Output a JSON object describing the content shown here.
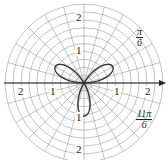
{
  "chart_data": {
    "type": "polar-line",
    "title": "",
    "equation_hint": "three-leaved rose (petals at π/6, 5π/6, 3π/2)",
    "series": [
      {
        "name": "rose",
        "function": "r = sin(3θ)",
        "petal_angles_deg": [
          30,
          150,
          270
        ],
        "max_r": 1,
        "color": "#333333"
      }
    ],
    "radial_range": [
      0,
      2.5
    ],
    "radial_grid_step": 0.25,
    "angular_grid_step_deg": 15,
    "radial_tick_labels": [
      {
        "text": "1",
        "position": "right"
      },
      {
        "text": "2",
        "position": "right"
      },
      {
        "text": "1",
        "position": "left"
      },
      {
        "text": "2",
        "position": "left"
      },
      {
        "text": "1",
        "position": "top"
      },
      {
        "text": "2",
        "position": "top"
      },
      {
        "text": "1",
        "position": "bottom"
      },
      {
        "text": "2",
        "position": "bottom"
      }
    ],
    "angle_labels": [
      {
        "numerator": "π",
        "denominator": "6"
      },
      {
        "numerator": "11π",
        "denominator": "6"
      }
    ],
    "grid": true,
    "polar_axis_arrow": true
  },
  "labels": {
    "right1": "1",
    "right2": "2",
    "left1": "1",
    "left2": "2",
    "top1": "1",
    "top2": "2",
    "bottom1": "1",
    "bottom2": "2",
    "pi6_num": "π",
    "pi6_den": "6",
    "pi116_num": "11π",
    "pi116_den": "6"
  }
}
